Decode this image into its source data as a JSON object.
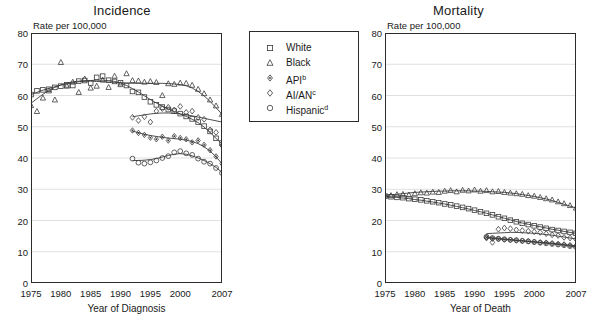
{
  "legend": {
    "items": [
      {
        "label": "White",
        "marker": "square",
        "suffix": ""
      },
      {
        "label": "Black",
        "marker": "triangle",
        "suffix": ""
      },
      {
        "label": "API",
        "marker": "diamond-dot",
        "suffix": "b"
      },
      {
        "label": "AI/AN",
        "marker": "diamond",
        "suffix": "c"
      },
      {
        "label": "Hispanic",
        "marker": "circle",
        "suffix": "d"
      }
    ]
  },
  "chart_data": [
    {
      "type": "scatter",
      "title": "Incidence",
      "ylabel": "Rate per 100,000",
      "xlabel": "Year of Diagnosis",
      "xlim": [
        1975,
        2007
      ],
      "ylim": [
        0,
        80
      ],
      "yticks": [
        0,
        10,
        20,
        30,
        40,
        50,
        60,
        70,
        80
      ],
      "xticks": [
        1975,
        1980,
        1985,
        1990,
        1995,
        2000,
        2007
      ],
      "grid": true,
      "legend_position": "center",
      "series": [
        {
          "name": "White",
          "marker": "square",
          "x": [
            1975,
            1976,
            1977,
            1978,
            1979,
            1980,
            1981,
            1982,
            1983,
            1984,
            1985,
            1986,
            1987,
            1988,
            1989,
            1990,
            1991,
            1992,
            1993,
            1994,
            1995,
            1996,
            1997,
            1998,
            1999,
            2000,
            2001,
            2002,
            2003,
            2004,
            2005,
            2006,
            2007
          ],
          "y": [
            60.3,
            61.5,
            61.8,
            62.0,
            62.6,
            63.0,
            63.4,
            63.2,
            64.6,
            64.8,
            64.0,
            65.8,
            66.2,
            64.9,
            64.5,
            64.1,
            63.2,
            61.3,
            61.0,
            59.5,
            58.0,
            57.0,
            56.3,
            55.5,
            55.0,
            54.2,
            53.3,
            52.5,
            51.5,
            50.2,
            48.5,
            46.3,
            44.8
          ],
          "trend": [
            60.3,
            61.0,
            61.7,
            62.3,
            62.8,
            63.3,
            63.7,
            64.1,
            64.4,
            64.6,
            64.8,
            64.9,
            64.9,
            64.8,
            64.5,
            64.0,
            63.2,
            62.2,
            61.1,
            59.9,
            58.7,
            57.6,
            56.6,
            55.7,
            54.9,
            54.1,
            53.3,
            52.4,
            51.3,
            49.9,
            48.2,
            46.3,
            44.5
          ]
        },
        {
          "name": "Black",
          "marker": "triangle",
          "x": [
            1975,
            1976,
            1977,
            1978,
            1979,
            1980,
            1981,
            1982,
            1983,
            1984,
            1985,
            1986,
            1987,
            1988,
            1989,
            1990,
            1991,
            1992,
            1993,
            1994,
            1995,
            1996,
            1997,
            1998,
            1999,
            2000,
            2001,
            2002,
            2003,
            2004,
            2005,
            2006,
            2007
          ],
          "y": [
            56.8,
            54.9,
            59.2,
            61.5,
            58.6,
            70.6,
            63.0,
            64.3,
            61.0,
            65.3,
            62.4,
            63.0,
            65.0,
            62.6,
            66.2,
            63.5,
            67.0,
            64.8,
            64.7,
            64.3,
            64.5,
            64.2,
            60.0,
            63.8,
            63.6,
            64.0,
            63.9,
            63.3,
            62.0,
            60.6,
            58.6,
            56.7,
            54.0
          ],
          "trend": [
            57.5,
            59.0,
            60.4,
            61.6,
            62.6,
            63.4,
            64.0,
            64.4,
            64.6,
            64.7,
            64.6,
            64.5,
            64.4,
            64.3,
            64.2,
            64.1,
            64.0,
            63.9,
            63.9,
            63.9,
            63.9,
            63.9,
            63.9,
            63.8,
            63.7,
            63.5,
            63.1,
            62.4,
            61.3,
            59.9,
            58.1,
            56.1,
            54.0
          ]
        },
        {
          "name": "API",
          "marker": "diamond-dot",
          "x": [
            1992,
            1993,
            1994,
            1995,
            1996,
            1997,
            1998,
            1999,
            2000,
            2001,
            2002,
            2003,
            2004,
            2005,
            2006,
            2007
          ],
          "y": [
            48.8,
            48.0,
            47.4,
            46.5,
            46.0,
            46.8,
            45.6,
            47.0,
            46.4,
            46.0,
            45.0,
            45.6,
            44.2,
            42.5,
            40.5,
            38.2
          ],
          "trend": [
            48.6,
            48.1,
            47.6,
            47.2,
            46.9,
            46.6,
            46.4,
            46.2,
            46.0,
            45.7,
            45.3,
            44.6,
            43.6,
            42.2,
            40.4,
            38.2
          ]
        },
        {
          "name": "AI/AN",
          "marker": "diamond",
          "x": [
            1992,
            1993,
            1994,
            1995,
            1996,
            1997,
            1998,
            1999,
            2000,
            2001,
            2002,
            2003,
            2004,
            2005,
            2006,
            2007
          ],
          "y": [
            53.0,
            52.0,
            53.2,
            51.5,
            55.0,
            55.8,
            56.2,
            55.4,
            56.5,
            54.6,
            55.0,
            53.0,
            52.4,
            49.0,
            48.2,
            44.0
          ],
          "trend": [
            53.2,
            53.5,
            53.8,
            54.1,
            54.3,
            54.4,
            54.4,
            54.3,
            54.1,
            53.8,
            53.5,
            53.1,
            52.7,
            52.3,
            51.9,
            51.5
          ]
        },
        {
          "name": "Hispanic",
          "marker": "circle",
          "x": [
            1992,
            1993,
            1994,
            1995,
            1996,
            1997,
            1998,
            1999,
            2000,
            2001,
            2002,
            2003,
            2004,
            2005,
            2006,
            2007
          ],
          "y": [
            39.8,
            38.5,
            38.2,
            38.6,
            39.2,
            40.0,
            40.6,
            41.8,
            42.2,
            41.5,
            41.0,
            39.8,
            38.8,
            38.2,
            36.8,
            35.2
          ],
          "trend": [
            39.2,
            39.2,
            39.3,
            39.5,
            39.8,
            40.3,
            40.8,
            41.2,
            41.4,
            41.2,
            40.7,
            40.0,
            39.2,
            38.2,
            37.0,
            35.4
          ]
        }
      ]
    },
    {
      "type": "scatter",
      "title": "Mortality",
      "ylabel": "Rate per 100,000",
      "xlabel": "Year of Death",
      "xlim": [
        1975,
        2007
      ],
      "ylim": [
        0,
        80
      ],
      "yticks": [
        0,
        10,
        20,
        30,
        40,
        50,
        60,
        70,
        80
      ],
      "xticks": [
        1975,
        1980,
        1985,
        1990,
        1995,
        2000,
        2007
      ],
      "grid": true,
      "legend_position": "none",
      "series": [
        {
          "name": "White",
          "marker": "square",
          "x": [
            1975,
            1976,
            1977,
            1978,
            1979,
            1980,
            1981,
            1982,
            1983,
            1984,
            1985,
            1986,
            1987,
            1988,
            1989,
            1990,
            1991,
            1992,
            1993,
            1994,
            1995,
            1996,
            1997,
            1998,
            1999,
            2000,
            2001,
            2002,
            2003,
            2004,
            2005,
            2006,
            2007
          ],
          "y": [
            27.8,
            27.6,
            27.4,
            27.3,
            27.0,
            26.8,
            26.6,
            26.3,
            26.0,
            25.7,
            25.3,
            25.0,
            24.6,
            24.2,
            23.8,
            23.3,
            22.8,
            22.3,
            21.8,
            21.2,
            20.7,
            20.1,
            19.6,
            19.1,
            18.7,
            18.3,
            17.9,
            17.5,
            17.1,
            16.8,
            16.5,
            16.2,
            15.9
          ],
          "trend": [
            27.8,
            27.6,
            27.4,
            27.2,
            27.0,
            26.7,
            26.5,
            26.2,
            25.9,
            25.6,
            25.3,
            24.9,
            24.5,
            24.1,
            23.7,
            23.2,
            22.8,
            22.3,
            21.8,
            21.3,
            20.7,
            20.2,
            19.7,
            19.2,
            18.8,
            18.4,
            18.0,
            17.6,
            17.2,
            16.9,
            16.5,
            16.2,
            15.9
          ]
        },
        {
          "name": "Black",
          "marker": "triangle",
          "x": [
            1975,
            1976,
            1977,
            1978,
            1979,
            1980,
            1981,
            1982,
            1983,
            1984,
            1985,
            1986,
            1987,
            1988,
            1989,
            1990,
            1991,
            1992,
            1993,
            1994,
            1995,
            1996,
            1997,
            1998,
            1999,
            2000,
            2001,
            2002,
            2003,
            2004,
            2005,
            2006,
            2007
          ],
          "y": [
            28.1,
            28.0,
            28.3,
            28.4,
            28.2,
            28.6,
            28.9,
            28.8,
            29.1,
            29.0,
            29.4,
            29.6,
            29.2,
            29.7,
            29.5,
            29.8,
            29.4,
            29.6,
            29.2,
            29.3,
            29.0,
            28.8,
            28.6,
            28.4,
            28.0,
            27.8,
            27.4,
            27.0,
            26.6,
            26.0,
            25.4,
            24.8,
            24.0
          ],
          "trend": [
            28.1,
            28.2,
            28.4,
            28.6,
            28.8,
            29.0,
            29.1,
            29.2,
            29.3,
            29.4,
            29.4,
            29.5,
            29.5,
            29.5,
            29.5,
            29.4,
            29.4,
            29.3,
            29.2,
            29.1,
            29.0,
            28.8,
            28.6,
            28.3,
            28.0,
            27.7,
            27.3,
            26.9,
            26.4,
            25.8,
            25.2,
            24.6,
            24.0
          ]
        },
        {
          "name": "API",
          "marker": "diamond-dot",
          "x": [
            1992,
            1993,
            1994,
            1995,
            1996,
            1997,
            1998,
            1999,
            2000,
            2001,
            2002,
            2003,
            2004,
            2005,
            2006,
            2007
          ],
          "y": [
            14.6,
            14.2,
            14.0,
            13.9,
            13.8,
            13.6,
            13.5,
            13.4,
            13.2,
            13.0,
            12.9,
            12.7,
            12.5,
            12.3,
            12.1,
            11.9
          ],
          "trend": [
            14.5,
            14.3,
            14.1,
            13.9,
            13.8,
            13.6,
            13.5,
            13.3,
            13.2,
            13.0,
            12.9,
            12.7,
            12.5,
            12.3,
            12.1,
            11.9
          ]
        },
        {
          "name": "AI/AN",
          "marker": "diamond",
          "x": [
            1992,
            1993,
            1994,
            1995,
            1996,
            1997,
            1998,
            1999,
            2000,
            2001,
            2002,
            2003,
            2004,
            2005,
            2006,
            2007
          ],
          "y": [
            14.4,
            13.0,
            17.2,
            17.6,
            17.4,
            17.0,
            16.8,
            16.6,
            16.4,
            16.2,
            15.8,
            15.4,
            15.2,
            14.6,
            14.4,
            14.0
          ],
          "trend": [
            15.8,
            15.9,
            16.0,
            16.1,
            16.2,
            16.2,
            16.1,
            16.0,
            15.9,
            15.7,
            15.5,
            15.3,
            15.0,
            14.7,
            14.4,
            14.1
          ]
        },
        {
          "name": "Hispanic",
          "marker": "circle",
          "x": [
            1992,
            1993,
            1994,
            1995,
            1996,
            1997,
            1998,
            1999,
            2000,
            2001,
            2002,
            2003,
            2004,
            2005,
            2006,
            2007
          ],
          "y": [
            14.8,
            14.4,
            14.2,
            14.0,
            13.8,
            13.7,
            13.5,
            13.3,
            13.1,
            12.9,
            12.7,
            12.5,
            12.3,
            12.1,
            11.8,
            11.5
          ],
          "trend": [
            14.7,
            14.5,
            14.3,
            14.1,
            13.9,
            13.7,
            13.5,
            13.3,
            13.1,
            12.9,
            12.7,
            12.5,
            12.3,
            12.1,
            11.8,
            11.5
          ]
        }
      ]
    }
  ]
}
